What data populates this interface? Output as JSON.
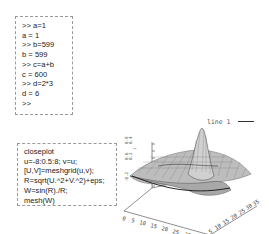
{
  "console": {
    "lines": [
      ">> a=1",
      "a = 1",
      ">> b=599",
      "b = 599",
      ">> c=a+b",
      "c = 600",
      ">> d=2*3",
      "d = 6",
      ">>"
    ]
  },
  "script": {
    "lines": [
      "closeplot",
      "u=-8:0.5:8; v=u;",
      "[U,V]=meshgrid(u,v);",
      "R=sqrt(U.^2+V.^2)+eps;",
      "W=sin(R)./R;",
      "mesh(W)"
    ]
  },
  "plot": {
    "legend_label": "line 1",
    "x_ticks": [
      "0",
      "5",
      "10",
      "15",
      "20",
      "25",
      "30",
      "35"
    ],
    "y_ticks": [
      "0",
      "5",
      "10",
      "15",
      "20",
      "25",
      "30",
      "35"
    ],
    "z_ticks": [
      "1",
      "0.8",
      "0.6",
      "0.4",
      "0.2",
      "0",
      "-0.2"
    ],
    "type": "mesh",
    "function": "sin(R)./R"
  }
}
